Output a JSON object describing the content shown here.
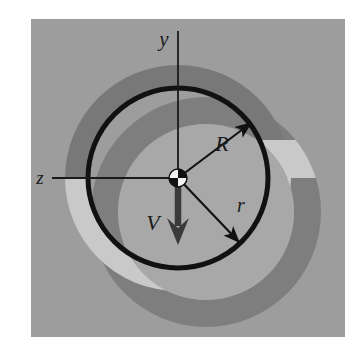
{
  "figure": {
    "kind": "physics-diagram",
    "page_background": "#ffffff",
    "panel": {
      "name": "diagram-panel",
      "background": "#9d9d9d",
      "x": 31,
      "y": 19,
      "width": 314,
      "height": 318
    },
    "colors": {
      "panel_gray": "#9d9d9d",
      "dark_ring_gray": "#7b7b7b",
      "light_ring_gray": "#c8c8c8",
      "inner_disk_gray": "#a9a9a9",
      "stroke_black": "#111111",
      "marker_white": "#f2f2f2",
      "marker_black": "#111111"
    },
    "origin": {
      "x": 178,
      "y": 178
    },
    "main_circle": {
      "name": "bold-circle-R",
      "center_x": 178,
      "center_y": 178,
      "radius": 90,
      "stroke": "#111111",
      "stroke_width": 5
    },
    "shifted_region": {
      "name": "offset-annulus",
      "center_x": 206,
      "center_y": 212,
      "outer_radius": 115,
      "inner_radius": 88
    },
    "centered_region": {
      "name": "centered-annulus",
      "center_x": 178,
      "center_y": 178,
      "outer_radius": 113,
      "inner_radius": 90
    },
    "axes": [
      {
        "id": "y-axis",
        "label": "y",
        "orientation": "vertical",
        "label_x": 164,
        "label_y": 46,
        "line_x1": 178,
        "line_y1": 31,
        "line_x2": 178,
        "line_y2": 178
      },
      {
        "id": "z-axis",
        "label": "z",
        "orientation": "horizontal",
        "label_x": 39,
        "label_y": 183,
        "line_x1": 52,
        "line_y1": 178,
        "line_x2": 178,
        "line_y2": 178
      }
    ],
    "vectors": [
      {
        "id": "radius-R-arrow",
        "label": "R",
        "label_x": 222,
        "label_y": 150,
        "from_x": 178,
        "from_y": 178,
        "to_x": 252,
        "to_y": 122,
        "style": "thin-arrow"
      },
      {
        "id": "radius-r-arrow",
        "label": "r",
        "label_x": 240,
        "label_y": 209,
        "from_x": 178,
        "from_y": 178,
        "to_x": 240,
        "to_y": 243,
        "style": "thin-arrow"
      },
      {
        "id": "velocity-V-arrow",
        "label": "V",
        "label_x": 152,
        "label_y": 227,
        "from_x": 178,
        "from_y": 178,
        "to_x": 178,
        "to_y": 243,
        "style": "thick-arrow"
      }
    ],
    "origin_marker": {
      "name": "origin-checkered-marker",
      "center_x": 178,
      "center_y": 178,
      "radius": 9,
      "pattern": "checkered-quadrants",
      "white_quadrants": "upper-left, lower-right",
      "black_quadrants": "upper-right, lower-left"
    }
  }
}
